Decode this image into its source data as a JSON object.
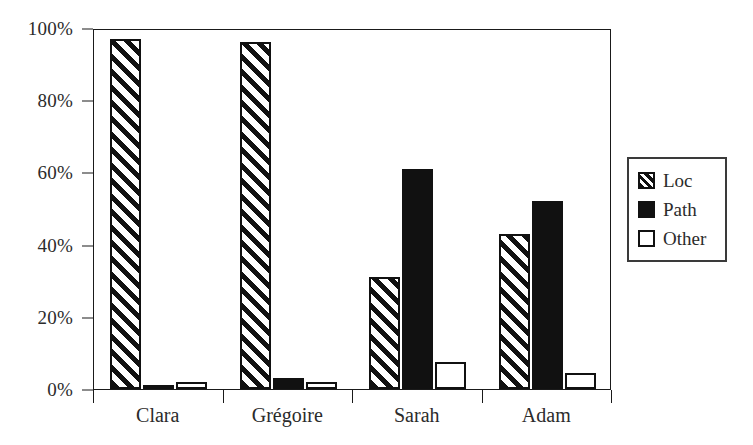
{
  "chart_data": {
    "type": "bar",
    "title": "",
    "subtitle": "",
    "xlabel": "",
    "ylabel": "",
    "categories": [
      "Clara",
      "Grégoire",
      "Sarah",
      "Adam"
    ],
    "series": [
      {
        "name": "Loc",
        "fill": "diagonal-hatch",
        "values": [
          97,
          96,
          31,
          43
        ]
      },
      {
        "name": "Path",
        "fill": "solid-black",
        "values": [
          1,
          3,
          61,
          52
        ]
      },
      {
        "name": "Other",
        "fill": "white",
        "values": [
          2,
          2,
          7.5,
          4.5
        ]
      }
    ],
    "ylim": [
      0,
      100
    ],
    "y_ticks": [
      0,
      20,
      40,
      60,
      80,
      100
    ],
    "y_tick_labels": [
      "0%",
      "20%",
      "40%",
      "60%",
      "80%",
      "100%"
    ],
    "value_suffix": "%",
    "grid": false,
    "legend_position": "right",
    "colors": {
      "ink": "#111111",
      "text": "#2b2b2b",
      "background": "#ffffff",
      "frame": "#1a1a1a"
    }
  },
  "legend": {
    "entries": [
      {
        "label": "Loc"
      },
      {
        "label": "Path"
      },
      {
        "label": "Other"
      }
    ]
  }
}
